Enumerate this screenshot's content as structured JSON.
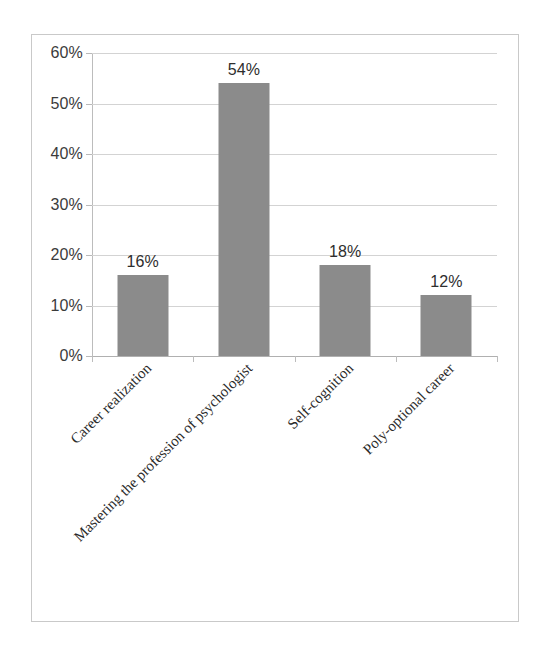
{
  "chart_data": {
    "type": "bar",
    "title": "",
    "subtitle": "",
    "xlabel": "",
    "ylabel": "",
    "categories": [
      "Career realization",
      "Mastering the profession of psychologist",
      "Self-cognition",
      "Poly-optional career"
    ],
    "values": [
      16,
      54,
      18,
      12
    ],
    "value_labels": [
      "16%",
      "54%",
      "18%",
      "12%"
    ],
    "ylim": [
      0,
      60
    ],
    "ytick_labels": [
      "0%",
      "10%",
      "20%",
      "30%",
      "40%",
      "50%",
      "60%"
    ],
    "ytick_values": [
      0,
      10,
      20,
      30,
      40,
      50,
      60
    ],
    "grid": true,
    "legend": false,
    "legend_position": "none",
    "series": [
      {
        "name": "",
        "values": [
          16,
          54,
          18,
          12
        ]
      }
    ],
    "bar_color": "#8b8b8b",
    "gridline_color": "#d3d3d3",
    "axis_color": "#bcbcbc",
    "text_color": "#2e2e2e",
    "background_color": "#ffffff",
    "frame_border_color": "#c9c9c9",
    "label_rotation_degrees": -45
  }
}
